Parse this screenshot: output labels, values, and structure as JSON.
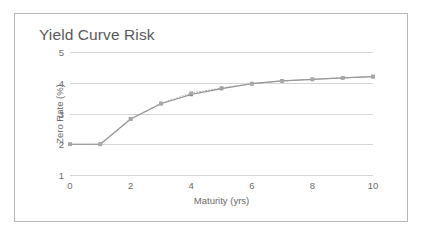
{
  "chart_data": {
    "type": "line",
    "title": "Yield Curve Risk",
    "xlabel": "Maturity (yrs)",
    "ylabel": "Zero Rate (%)",
    "xlim": [
      0,
      10
    ],
    "ylim": [
      1,
      5
    ],
    "xticks": [
      0,
      2,
      4,
      6,
      8,
      10
    ],
    "yticks": [
      1,
      2,
      3,
      4,
      5
    ],
    "xtick_labels": [
      "0",
      "2",
      "4",
      "6",
      "8",
      "10"
    ],
    "ytick_labels": [
      "1",
      "2",
      "3",
      "4",
      "5"
    ],
    "grid": "horizontal",
    "legend": "none",
    "x": [
      0,
      1,
      2,
      3,
      4,
      5,
      6,
      7,
      8,
      9,
      10
    ],
    "series": [
      {
        "name": "Base zero curve",
        "color": "#8a8a8a",
        "marker": "square",
        "line_style": "solid",
        "values": [
          2.0,
          2.0,
          2.82,
          3.32,
          3.62,
          3.81,
          3.97,
          4.06,
          4.11,
          4.16,
          4.2
        ]
      },
      {
        "name": "Shifted zero curve",
        "color": "#a8a8a8",
        "marker": "square",
        "line_style": "dotted",
        "values": [
          2.0,
          2.0,
          2.82,
          3.33,
          3.66,
          3.83,
          3.97,
          4.06,
          4.11,
          4.16,
          4.2
        ]
      }
    ]
  },
  "chart": {
    "title": "Yield Curve Risk",
    "x_axis_title": "Maturity (yrs)",
    "y_axis_title": "Zero Rate (%)"
  },
  "colors": {
    "frame_border": "#b9b9b9",
    "gridline": "#d6d6d6",
    "tick_text": "#6b6b6b",
    "title_text": "#595959",
    "series_primary": "#8a8a8a",
    "series_secondary": "#a8a8a8",
    "background": "#ffffff"
  }
}
